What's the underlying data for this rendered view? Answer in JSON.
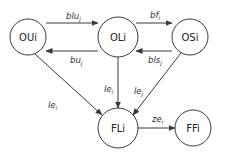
{
  "diagram": {
    "nodes": [
      {
        "id": "OUi",
        "label": "OUi",
        "cx": 28,
        "cy": 37,
        "r": 18
      },
      {
        "id": "OLi",
        "label": "OLi",
        "cx": 118,
        "cy": 37,
        "r": 20
      },
      {
        "id": "OSi",
        "label": "OSi",
        "cx": 190,
        "cy": 37,
        "r": 18
      },
      {
        "id": "FLi",
        "label": "FLi",
        "cx": 118,
        "cy": 128,
        "r": 20
      },
      {
        "id": "FFi",
        "label": "FFi",
        "cx": 193,
        "cy": 128,
        "r": 18
      }
    ],
    "edges": [
      {
        "from": "OUi",
        "to": "OLi",
        "label": "blu",
        "sub": "j"
      },
      {
        "from": "OLi",
        "to": "OUi",
        "label": "bu",
        "sub": "j"
      },
      {
        "from": "OLi",
        "to": "OSi",
        "label": "bf",
        "sub": "i"
      },
      {
        "from": "OSi",
        "to": "OLi",
        "label": "bls",
        "sub": "j"
      },
      {
        "from": "OUi",
        "to": "FLi",
        "label": "le",
        "sub": "i"
      },
      {
        "from": "OLi",
        "to": "FLi",
        "label": "le",
        "sub": "i"
      },
      {
        "from": "OSi",
        "to": "FLi",
        "label": "le",
        "sub": "j"
      },
      {
        "from": "FLi",
        "to": "FFi",
        "label": "ze",
        "sub": "i"
      }
    ]
  }
}
